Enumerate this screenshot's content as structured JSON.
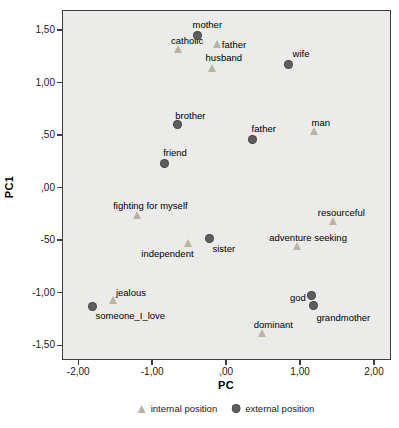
{
  "chart_data": {
    "type": "scatter",
    "title": "",
    "xlabel": "PC",
    "ylabel": "PC1",
    "xlim": [
      -2.22,
      2.23
    ],
    "ylim": [
      -1.64,
      1.69
    ],
    "grid": false,
    "legend_position": "bottom-center",
    "plot_bg": "#ebebe9",
    "frame_color": "#3d3d3d",
    "x_ticks": [
      {
        "value": -2.0,
        "label": "-2,00"
      },
      {
        "value": -1.0,
        "label": "-1,00"
      },
      {
        "value": 0.0,
        "label": ",00"
      },
      {
        "value": 1.0,
        "label": "1,00"
      },
      {
        "value": 2.0,
        "label": "2,00"
      }
    ],
    "y_ticks": [
      {
        "value": 1.5,
        "label": "1,50"
      },
      {
        "value": 1.0,
        "label": "1,00"
      },
      {
        "value": 0.5,
        "label": ",50"
      },
      {
        "value": 0.0,
        "label": ",00"
      },
      {
        "value": -0.5,
        "label": "-50"
      },
      {
        "value": -1.0,
        "label": "-1,00"
      },
      {
        "value": -1.5,
        "label": "-1,50"
      }
    ],
    "legend": [
      {
        "label": "internal position",
        "marker": "triangle",
        "color": "#bab2a3"
      },
      {
        "label": "external position",
        "marker": "circle",
        "color": "#5e5e5e"
      }
    ],
    "series": [
      {
        "name": "internal position",
        "marker": "triangle",
        "color": "#bab2a3",
        "points": [
          {
            "label": "catholic",
            "x": -0.65,
            "y": 1.32,
            "label_dx": 9,
            "label_dy": -9
          },
          {
            "label": "father",
            "x": -0.11,
            "y": 1.37,
            "label_dx": 16,
            "label_dy": 0
          },
          {
            "label": "husband",
            "x": -0.18,
            "y": 1.14,
            "label_dx": 11,
            "label_dy": -11
          },
          {
            "label": "man",
            "x": 1.2,
            "y": 0.54,
            "label_dx": 6,
            "label_dy": -9
          },
          {
            "label": "fighting for myself",
            "x": -1.2,
            "y": -0.26,
            "label_dx": 13,
            "label_dy": -10
          },
          {
            "label": "resourceful",
            "x": 1.45,
            "y": -0.32,
            "label_dx": 8,
            "label_dy": -9
          },
          {
            "label": "adventure seeking",
            "x": 0.96,
            "y": -0.56,
            "label_dx": 11,
            "label_dy": -9
          },
          {
            "label": "independent",
            "x": -0.51,
            "y": -0.53,
            "label_dx": -21,
            "label_dy": 10
          },
          {
            "label": "jealous",
            "x": -1.53,
            "y": -1.07,
            "label_dx": 18,
            "label_dy": -8
          },
          {
            "label": "dominant",
            "x": 0.49,
            "y": -1.38,
            "label_dx": 11,
            "label_dy": -9
          }
        ]
      },
      {
        "name": "external position",
        "marker": "circle",
        "color": "#5e5e5e",
        "points": [
          {
            "label": "mother",
            "x": -0.39,
            "y": 1.45,
            "label_dx": 10,
            "label_dy": -11
          },
          {
            "label": "wife",
            "x": 0.85,
            "y": 1.17,
            "label_dx": 12,
            "label_dy": -12
          },
          {
            "label": "brother",
            "x": -0.66,
            "y": 0.6,
            "label_dx": 13,
            "label_dy": -10
          },
          {
            "label": "father",
            "x": 0.36,
            "y": 0.46,
            "label_dx": 11,
            "label_dy": -11
          },
          {
            "label": "friend",
            "x": -0.84,
            "y": 0.23,
            "label_dx": 11,
            "label_dy": -11
          },
          {
            "label": "sister",
            "x": -0.22,
            "y": -0.48,
            "label_dx": 14,
            "label_dy": 10
          },
          {
            "label": "someone_I_love",
            "x": -1.81,
            "y": -1.13,
            "label_dx": 38,
            "label_dy": 9
          },
          {
            "label": "god",
            "x": 1.16,
            "y": -1.03,
            "label_dx": -14,
            "label_dy": 1
          },
          {
            "label": "grandmother",
            "x": 1.18,
            "y": -1.12,
            "label_dx": 30,
            "label_dy": 12
          }
        ]
      }
    ]
  }
}
